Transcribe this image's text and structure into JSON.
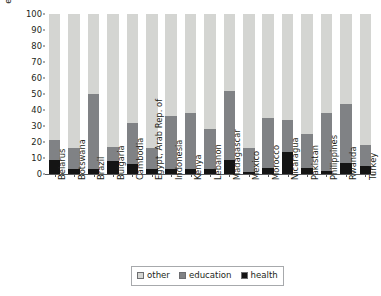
{
  "chart_data": {
    "type": "bar",
    "subtype": "stacked-percentage",
    "title": "",
    "subtitle": "",
    "xlabel": "",
    "ylabel": "employee distribution (%)",
    "ylim": [
      0,
      100
    ],
    "ytick_labels": [
      "0",
      "10",
      "20",
      "30",
      "40",
      "50",
      "60",
      "70",
      "80",
      "90",
      "100"
    ],
    "ytick_values": [
      0,
      10,
      20,
      30,
      40,
      50,
      60,
      70,
      80,
      90,
      100
    ],
    "grid": false,
    "legend_position": "bottom-center",
    "categories": [
      "Belarus",
      "Botswana",
      "Brazil",
      "Bulgaria",
      "Cambodia",
      "Egypt, Arab Rep. of",
      "Indonesia",
      "Kenya",
      "Lebanon",
      "Madagascar",
      "Mexico",
      "Morocco",
      "Nicaragua",
      "Pakistan",
      "Philippines",
      "Rwanda",
      "Turkey"
    ],
    "series": [
      {
        "name": "health",
        "color": "#141414",
        "values": [
          9,
          3,
          3,
          8,
          6,
          3,
          3,
          3,
          3,
          9,
          1,
          4,
          14,
          4,
          2,
          7,
          5
        ]
      },
      {
        "name": "education",
        "color": "#808285",
        "values": [
          12,
          13,
          47,
          9,
          26,
          13,
          33,
          35,
          25,
          43,
          15,
          31,
          20,
          21,
          36,
          37,
          13
        ]
      },
      {
        "name": "other",
        "color": "#d4d5d2",
        "values": [
          79,
          84,
          50,
          83,
          68,
          84,
          64,
          62,
          72,
          48,
          84,
          65,
          66,
          75,
          62,
          56,
          82
        ]
      }
    ],
    "cumulative_tops": {
      "health": [
        9,
        3,
        3,
        8,
        6,
        3,
        3,
        3,
        3,
        9,
        1,
        4,
        14,
        4,
        2,
        7,
        5
      ],
      "education": [
        21,
        16,
        50,
        17,
        32,
        16,
        36,
        38,
        28,
        52,
        16,
        35,
        34,
        25,
        38,
        44,
        18
      ],
      "other": [
        100,
        100,
        100,
        100,
        100,
        100,
        100,
        100,
        100,
        100,
        100,
        100,
        100,
        100,
        100,
        100,
        100
      ]
    },
    "legend": [
      {
        "label": "other",
        "color": "#d4d5d2"
      },
      {
        "label": "education",
        "color": "#808285"
      },
      {
        "label": "health",
        "color": "#141414"
      }
    ]
  }
}
